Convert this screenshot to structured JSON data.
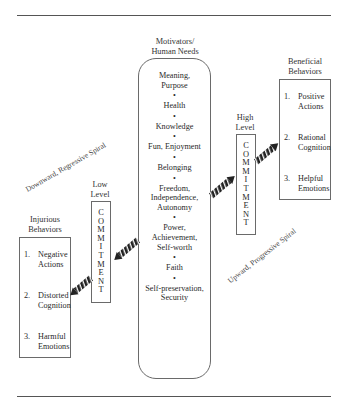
{
  "diagram": {
    "motivators": {
      "title_line1": "Motivators/",
      "title_line2": "Human Needs",
      "needs": [
        [
          "Meaning,",
          "Purpose"
        ],
        [
          "Health"
        ],
        [
          "Knowledge"
        ],
        [
          "Fun, Enjoyment"
        ],
        [
          "Belonging"
        ],
        [
          "Freedom,",
          "Independence,",
          "Autonomy"
        ],
        [
          "Power,",
          "Achievement,",
          "Self-worth"
        ],
        [
          "Faith"
        ],
        [
          "Self-preservation,",
          "Security"
        ]
      ],
      "bullet": "•"
    },
    "low_level": {
      "label_line1": "Low",
      "label_line2": "Level",
      "letters": [
        "C",
        "O",
        "M",
        "M",
        "I",
        "T",
        "M",
        "E",
        "N",
        "T"
      ]
    },
    "high_level": {
      "label_line1": "High",
      "label_line2": "Level",
      "letters": [
        "C",
        "O",
        "M",
        "M",
        "I",
        "T",
        "M",
        "E",
        "N",
        "T"
      ]
    },
    "injurious": {
      "title_line1": "Injurious",
      "title_line2": "Behaviors",
      "items": [
        {
          "num": "1.",
          "line1": "Negative",
          "line2": "Actions"
        },
        {
          "num": "2.",
          "line1": "Distorted",
          "line2": "Cognition"
        },
        {
          "num": "3.",
          "line1": "Harmful",
          "line2": "Emotions"
        }
      ]
    },
    "beneficial": {
      "title_line1": "Beneficial",
      "title_line2": "Behaviors",
      "items": [
        {
          "num": "1.",
          "line1": "Positive",
          "line2": "Actions"
        },
        {
          "num": "2.",
          "line1": "Rational",
          "line2": "Cognition"
        },
        {
          "num": "3.",
          "line1": "Helpful",
          "line2": "Emotions"
        }
      ]
    },
    "downward_label": "Downward, Regressive Spiral",
    "upward_label": "Upward, Progressive Spiral",
    "colors": {
      "line": "#555555",
      "arrow": "#222222",
      "text": "#333333"
    }
  }
}
